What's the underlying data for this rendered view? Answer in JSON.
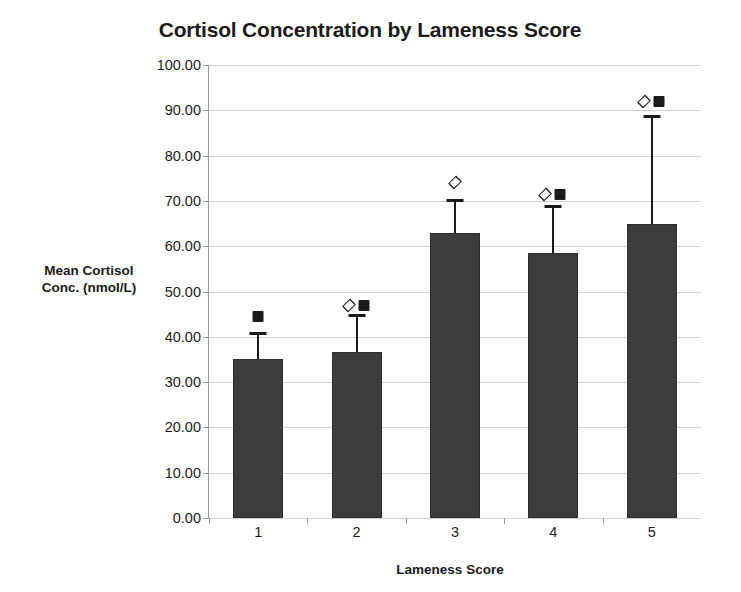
{
  "chart_data": {
    "type": "bar",
    "title": "Cortisol Concentration by Lameness Score",
    "xlabel": "Lameness Score",
    "ylabel": "Mean Cortisol Conc. (nmol/L)",
    "ylabel_line1": "Mean Cortisol",
    "ylabel_line2": "Conc. (nmol/L)",
    "categories": [
      "1",
      "2",
      "3",
      "4",
      "5"
    ],
    "values": [
      35.0,
      36.7,
      63.0,
      58.5,
      65.0
    ],
    "error_upper": [
      41.0,
      45.0,
      70.5,
      69.0,
      89.0
    ],
    "annotations": [
      {
        "category": "1",
        "symbols": [
          "square"
        ],
        "y": 44.5
      },
      {
        "category": "2",
        "symbols": [
          "diamond",
          "square"
        ],
        "y": 47.0
      },
      {
        "category": "3",
        "symbols": [
          "diamond"
        ],
        "y": 74.0
      },
      {
        "category": "4",
        "symbols": [
          "diamond",
          "square"
        ],
        "y": 71.5
      },
      {
        "category": "5",
        "symbols": [
          "diamond",
          "square"
        ],
        "y": 92.0
      }
    ],
    "ylim": [
      0,
      100
    ],
    "ytick_step": 10,
    "ytick_labels": [
      "100.00",
      "90.00",
      "80.00",
      "70.00",
      "60.00",
      "50.00",
      "40.00",
      "30.00",
      "20.00",
      "10.00",
      "0.00"
    ],
    "ytick_values": [
      100,
      90,
      80,
      70,
      60,
      50,
      40,
      30,
      20,
      10,
      0
    ],
    "grid": true,
    "legend": "none",
    "bar_color": "#3c3c3c",
    "grid_color": "#d2d2d2",
    "axis_color": "#9a9a9a",
    "text_color": "#1b1b1b"
  }
}
